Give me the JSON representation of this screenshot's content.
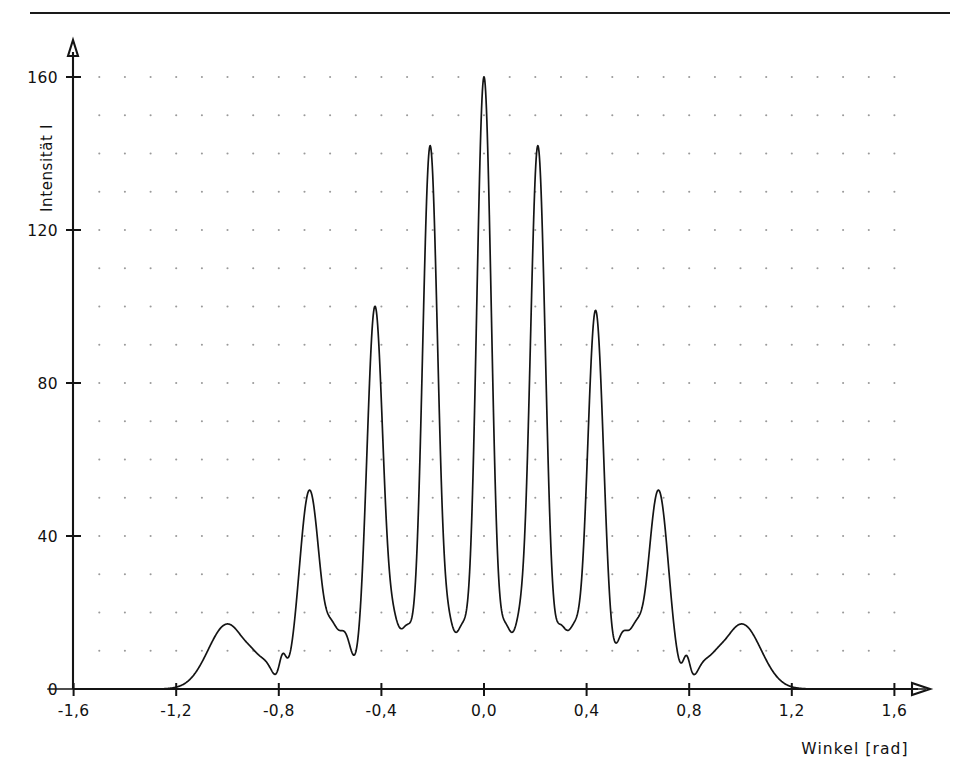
{
  "figure": {
    "has_top_rule": true,
    "background_color": "#ffffff",
    "line_color": "#141414",
    "grid_dot_color": "#9a9a9a"
  },
  "chart_data": {
    "type": "line",
    "title": "",
    "subtitle": "",
    "xlabel": "Winkel  [rad]",
    "ylabel": "Intensität I",
    "xlim": [
      -1.75,
      1.78
    ],
    "ylim": [
      0,
      172
    ],
    "xticks": [
      -1.6,
      -1.2,
      -0.8,
      -0.4,
      0.0,
      0.4,
      0.8,
      1.2,
      1.6
    ],
    "xticklabels": [
      "-1,6",
      "-1,2",
      "-0,8",
      "-0,4",
      "0,0",
      "0,4",
      "0,8",
      "1,2",
      "1,6"
    ],
    "yticks": [
      0,
      40,
      80,
      120,
      160
    ],
    "yticklabels": [
      "0",
      "40",
      "80",
      "120",
      "160"
    ],
    "grid": "dotted",
    "grid_dot_x_step": 0.1,
    "grid_dot_y_step": 10,
    "legend": "none",
    "curve_color": "#141414",
    "series": [
      {
        "name": "Intensität I",
        "comment": "Mehrfachspalt-Interferenz: Hauptmaxima mit Nebenmaxima",
        "peaks": [
          {
            "x": -1.0,
            "height": 17,
            "width": 0.075,
            "kind": "main"
          },
          {
            "x": -0.895,
            "height": 3,
            "width": 0.03,
            "kind": "side"
          },
          {
            "x": -0.845,
            "height": 4,
            "width": 0.026,
            "kind": "side"
          },
          {
            "x": -0.785,
            "height": 7,
            "width": 0.014,
            "kind": "side"
          },
          {
            "x": -0.68,
            "height": 52,
            "width": 0.04,
            "kind": "main"
          },
          {
            "x": -0.59,
            "height": 12,
            "width": 0.024,
            "kind": "side"
          },
          {
            "x": -0.54,
            "height": 13,
            "width": 0.024,
            "kind": "side"
          },
          {
            "x": -0.425,
            "height": 100,
            "width": 0.032,
            "kind": "main"
          },
          {
            "x": -0.35,
            "height": 13,
            "width": 0.023,
            "kind": "side"
          },
          {
            "x": -0.3,
            "height": 14,
            "width": 0.023,
            "kind": "side"
          },
          {
            "x": -0.21,
            "height": 142,
            "width": 0.03,
            "kind": "main"
          },
          {
            "x": -0.135,
            "height": 13,
            "width": 0.022,
            "kind": "side"
          },
          {
            "x": -0.085,
            "height": 14,
            "width": 0.022,
            "kind": "side"
          },
          {
            "x": 0.0,
            "height": 160,
            "width": 0.029,
            "kind": "main"
          },
          {
            "x": 0.085,
            "height": 14,
            "width": 0.022,
            "kind": "side"
          },
          {
            "x": 0.135,
            "height": 13,
            "width": 0.022,
            "kind": "side"
          },
          {
            "x": 0.21,
            "height": 142,
            "width": 0.03,
            "kind": "main"
          },
          {
            "x": 0.3,
            "height": 14,
            "width": 0.023,
            "kind": "side"
          },
          {
            "x": 0.35,
            "height": 13,
            "width": 0.023,
            "kind": "side"
          },
          {
            "x": 0.435,
            "height": 99,
            "width": 0.032,
            "kind": "main"
          },
          {
            "x": 0.54,
            "height": 13,
            "width": 0.024,
            "kind": "side"
          },
          {
            "x": 0.59,
            "height": 12,
            "width": 0.024,
            "kind": "side"
          },
          {
            "x": 0.68,
            "height": 52,
            "width": 0.04,
            "kind": "main"
          },
          {
            "x": 0.79,
            "height": 7,
            "width": 0.014,
            "kind": "side"
          },
          {
            "x": 0.85,
            "height": 4,
            "width": 0.026,
            "kind": "side"
          },
          {
            "x": 0.9,
            "height": 3,
            "width": 0.03,
            "kind": "side"
          },
          {
            "x": 1.005,
            "height": 17,
            "width": 0.075,
            "kind": "main"
          }
        ]
      }
    ]
  }
}
